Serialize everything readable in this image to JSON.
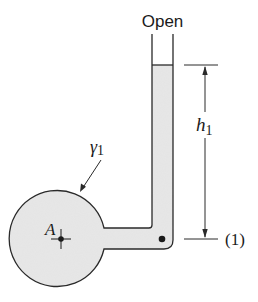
{
  "diagram": {
    "labels": {
      "open": "Open",
      "height": "h",
      "height_sub": "1",
      "specific_weight": "γ",
      "specific_weight_sub": "1",
      "point_a": "A",
      "level_marker": "(1)"
    },
    "colors": {
      "fluid": "#e4e4e4",
      "stroke": "#2a2a2a",
      "background": "#ffffff"
    }
  }
}
